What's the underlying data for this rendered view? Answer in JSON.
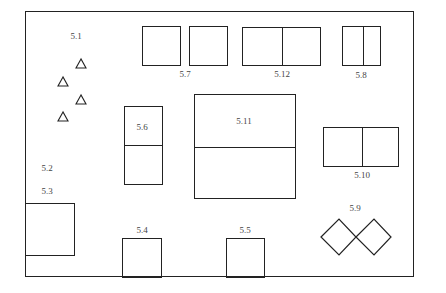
{
  "diagram": {
    "type": "floor-plan-layout",
    "labels": {
      "l51": "5.1",
      "l52": "5.2",
      "l53": "5.3",
      "l54": "5.4",
      "l55": "5.5",
      "l56": "5.6",
      "l57": "5.7",
      "l58": "5.8",
      "l59": "5.9",
      "l510": "5.10",
      "l511": "5.11",
      "l512": "5.12"
    },
    "elements": [
      {
        "id": "5.1",
        "shape": "triangles",
        "count": 4
      },
      {
        "id": "5.2",
        "shape": "label-only"
      },
      {
        "id": "5.3",
        "shape": "rectangle"
      },
      {
        "id": "5.4",
        "shape": "rectangle"
      },
      {
        "id": "5.5",
        "shape": "rectangle"
      },
      {
        "id": "5.6",
        "shape": "rectangle-split-horizontal",
        "parts": 2
      },
      {
        "id": "5.7",
        "shape": "two-squares"
      },
      {
        "id": "5.8",
        "shape": "rectangle-split-vertical",
        "parts": 2
      },
      {
        "id": "5.9",
        "shape": "two-diamonds"
      },
      {
        "id": "5.10",
        "shape": "rectangle-split-vertical",
        "parts": 2
      },
      {
        "id": "5.11",
        "shape": "rectangle-split-horizontal",
        "parts": 2
      },
      {
        "id": "5.12",
        "shape": "rectangle-split-vertical",
        "parts": 2
      }
    ]
  }
}
